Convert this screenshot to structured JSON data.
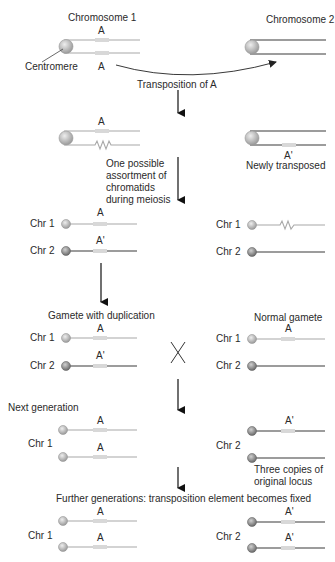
{
  "top": {
    "chromosome1_title": "Chromosome 1",
    "chromosome2_title": "Chromosome 2",
    "centromere_label": "Centromere",
    "locus_top": "A",
    "locus_bottom": "A",
    "transposition_label": "Transposition of A"
  },
  "step2": {
    "locus_label": "A",
    "new_locus_label": "A'",
    "newly_transposed": "Newly transposed",
    "assortment_lines": [
      "One possible",
      "assortment of",
      "chromatids",
      "during meiosis"
    ]
  },
  "step3": {
    "left": {
      "chr1": "Chr 1",
      "chr2": "Chr 2",
      "locus1": "A",
      "locus2": "A'"
    },
    "right": {
      "chr1": "Chr 1",
      "chr2": "Chr 2"
    }
  },
  "gametes": {
    "left_title": "Gamete with duplication",
    "right_title": "Normal gamete",
    "cross_symbol": "X",
    "left": {
      "chr1": "Chr 1",
      "chr2": "Chr 2",
      "locus1": "A",
      "locus2": "A'"
    },
    "right": {
      "chr1": "Chr 1",
      "chr2": "Chr 2",
      "locus1": "A"
    }
  },
  "next_generation": {
    "title": "Next generation",
    "chr1": "Chr 1",
    "chr2": "Chr 2",
    "locus_a1": "A",
    "locus_a2": "A",
    "locus_a3": "A'",
    "note_lines": [
      "Three copies of",
      "original locus"
    ]
  },
  "further_generations": {
    "title": "Further generations: transposition element becomes fixed",
    "chr1": "Chr 1",
    "chr2": "Chr 2",
    "locus_a1": "A",
    "locus_a2": "A",
    "locus_a3": "A'",
    "locus_a4": "A'"
  },
  "colors": {
    "chr1_line": "#a8a8a8",
    "chr2_line": "#3a3a3a",
    "locus_box": "#d8d8d8",
    "arrow": "#111111"
  }
}
